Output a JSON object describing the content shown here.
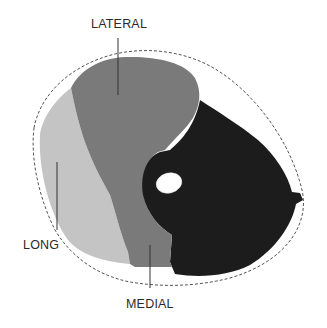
{
  "diagram": {
    "type": "cross-section of arm showing triceps heads",
    "labels": {
      "lateral": "LATERAL",
      "long": "LONG",
      "medial": "MEDIAL"
    },
    "regions": [
      {
        "name": "lateral-head",
        "color": "#7a7a7a"
      },
      {
        "name": "long-head",
        "color": "#c4c4c4"
      },
      {
        "name": "medial-head",
        "color": "#7a7a7a"
      },
      {
        "name": "other-tissue",
        "color": "#1c1c1c"
      },
      {
        "name": "bone",
        "color": "#ffffff"
      }
    ],
    "colors": {
      "outline": "#555555",
      "leader": "#333333",
      "background": "#ffffff"
    }
  }
}
